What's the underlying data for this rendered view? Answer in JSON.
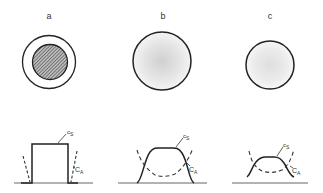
{
  "panels": [
    {
      "label": "a",
      "circle": {
        "type": "ring-with-hatched-core",
        "cx": 49,
        "cy": 62,
        "outer_r": 27,
        "inner_r": 18
      },
      "profile": {
        "shape": "step",
        "cs_label": "S",
        "ca_label": "A"
      }
    },
    {
      "label": "b",
      "circle": {
        "type": "diffuse-gray",
        "cx": 162,
        "cy": 61,
        "r": 29
      },
      "profile": {
        "shape": "smooth-plateau",
        "cs_label": "S",
        "ca_label": "A"
      }
    },
    {
      "label": "c",
      "circle": {
        "type": "diffuse-gray-faint",
        "cx": 270,
        "cy": 65,
        "r": 24
      },
      "profile": {
        "shape": "low-plateau",
        "cs_label": "S",
        "ca_label": "A"
      }
    }
  ],
  "curve_labels": {
    "cs_main": "c",
    "ca_main": "C"
  },
  "colors": {
    "line": "#222222",
    "dashed": "#333333",
    "baseline": "#666666",
    "hatch": "#555555"
  }
}
